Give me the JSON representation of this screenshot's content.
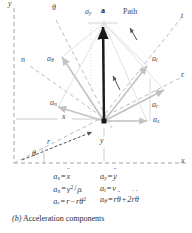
{
  "figure": {
    "caption_label": "(b)",
    "caption_text": "Acceleration components",
    "axes": {
      "y_axis": "y",
      "x_axis": "x",
      "n_axis": "n",
      "t_axis": "t",
      "r_axis": "r",
      "theta_axis": "θ"
    },
    "annotations": {
      "resultant": "a",
      "path": "Path",
      "x_distance": "x",
      "y_distance": "y",
      "radius": "r",
      "angle": "θ"
    },
    "components": {
      "a_x": {
        "base": "a",
        "sub": "x"
      },
      "a_y": {
        "base": "a",
        "sub": "y"
      },
      "a_n": {
        "base": "a",
        "sub": "n"
      },
      "a_t": {
        "base": "a",
        "sub": "t"
      },
      "a_r": {
        "base": "a",
        "sub": "r"
      },
      "a_theta": {
        "base": "a",
        "sub": "θ"
      }
    },
    "colors": {
      "resultant_vector": "#1a1a1a",
      "cartesian_component": "#b9b9b9",
      "normal_tangential_component": "#c9c9c9",
      "polar_component": "#bdbdbd",
      "axis_line": "#9a9a9a",
      "label_text": "#4a4a4a",
      "background": "#ffffff"
    }
  },
  "equations": {
    "left_column": [
      {
        "id": "eq-ax",
        "lhs_base": "a",
        "lhs_sub": "x",
        "rhs": "ẍ",
        "text": "a_x = ẍ"
      },
      {
        "id": "eq-an",
        "lhs_base": "a",
        "lhs_sub": "n",
        "rhs": "v²/ρ",
        "text": "a_n = v²/ρ"
      },
      {
        "id": "eq-ar",
        "lhs_base": "a",
        "lhs_sub": "r",
        "rhs": "r̈ − rθ̇²",
        "text": "a_r = r̈ − rθ̇²"
      }
    ],
    "right_column": [
      {
        "id": "eq-ay",
        "lhs_base": "a",
        "lhs_sub": "y",
        "rhs": "ÿ",
        "text": "a_y = ÿ"
      },
      {
        "id": "eq-at",
        "lhs_base": "a",
        "lhs_sub": "t",
        "rhs": "v̇",
        "text": "a_t = v̇"
      },
      {
        "id": "eq-atheta",
        "lhs_base": "a",
        "lhs_sub": "θ",
        "rhs": "rθ̈ + 2ṙθ̇",
        "text": "a_θ = rθ̈ + 2ṙθ̇"
      }
    ]
  }
}
